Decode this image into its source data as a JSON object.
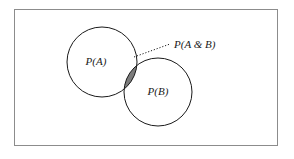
{
  "figure": {
    "type": "venn-diagram",
    "title": "",
    "background_color": "#ffffff",
    "frame": {
      "name": "universe-rectangle",
      "x": 14,
      "y": 9,
      "width": 264,
      "height": 137,
      "stroke_color": "#8c8c8c",
      "fill_color": "#ffffff",
      "stroke_width": 1
    }
  },
  "chart_data": {
    "type": "venn",
    "title": "",
    "xlabel": "",
    "ylabel": "",
    "grid": false,
    "legend_position": "none",
    "sets": [
      {
        "id": "A",
        "label": "P(A)",
        "cx": 102,
        "cy": 62,
        "r": 35,
        "stroke_color": "#1a1a1a",
        "fill_color": "none",
        "label_x": 96,
        "label_y": 65
      },
      {
        "id": "B",
        "label": "P(B)",
        "cx": 158,
        "cy": 92,
        "r": 34,
        "stroke_color": "#1a1a1a",
        "fill_color": "none",
        "label_x": 158,
        "label_y": 95
      }
    ],
    "intersection": {
      "id": "A-and-B",
      "label": "P(A & B)",
      "fill_color": "#7c7c7c",
      "stroke_color": "#1a1a1a",
      "label_x": 174,
      "label_y": 48,
      "leader_line": {
        "name": "dotted-leader-line",
        "x1": 134,
        "y1": 57,
        "x2": 170,
        "y2": 44,
        "style": "dotted",
        "stroke_color": "#1a1a1a"
      }
    }
  }
}
